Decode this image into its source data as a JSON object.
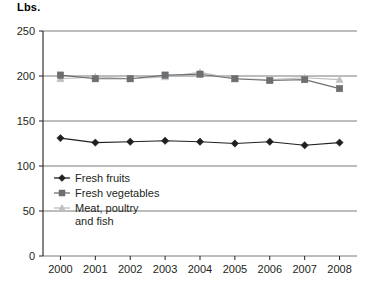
{
  "chart_data": {
    "type": "line",
    "title": "",
    "subtitle": "",
    "ylabel": "Lbs.",
    "xlabel": "",
    "x": [
      2000,
      2001,
      2002,
      2003,
      2004,
      2005,
      2006,
      2007,
      2008
    ],
    "categories": [
      "2000",
      "2001",
      "2002",
      "2003",
      "2004",
      "2005",
      "2006",
      "2007",
      "2008"
    ],
    "ylim": [
      0,
      250
    ],
    "yticks": [
      0,
      50,
      100,
      150,
      200,
      250
    ],
    "ytick_labels": [
      "0",
      "50",
      "100",
      "150",
      "200",
      "250"
    ],
    "grid": "horizontal",
    "legend_position": "inside-lower-left",
    "series": [
      {
        "name": "Fresh fruits",
        "marker": "diamond",
        "color": "#231f20",
        "values": [
          131,
          126,
          127,
          128,
          127,
          125,
          127,
          123,
          126
        ]
      },
      {
        "name": "Fresh vegetables",
        "marker": "square",
        "color": "#6d6e70",
        "values": [
          201,
          197,
          197,
          201,
          202,
          197,
          195,
          196,
          186
        ]
      },
      {
        "name": "Meat, poultry and fish",
        "marker": "triangle",
        "color": "#bcbec0",
        "values": [
          197,
          199,
          197,
          199,
          204,
          197,
          196,
          198,
          196
        ]
      }
    ],
    "legend": [
      {
        "label": "Fresh fruits",
        "marker": "diamond",
        "color": "#231f20"
      },
      {
        "label": "Fresh vegetables",
        "marker": "square",
        "color": "#6d6e70"
      },
      {
        "label": "Meat, poultry",
        "label_line2": "and fish",
        "marker": "triangle",
        "color": "#bcbec0"
      }
    ]
  }
}
